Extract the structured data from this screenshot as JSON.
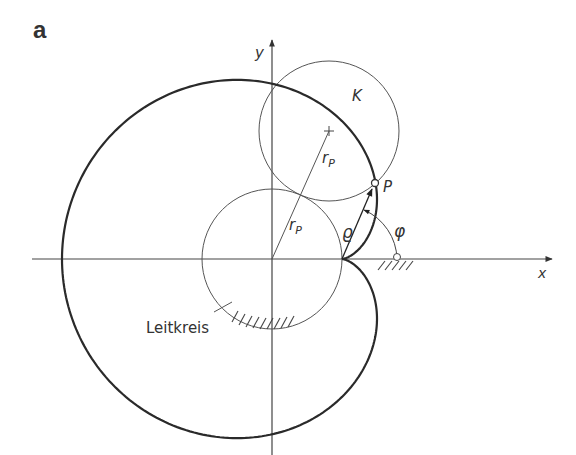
{
  "figure": {
    "panel_label": "a",
    "labels": {
      "y_axis": "y",
      "x_axis": "x",
      "rolling_circle": "K",
      "radius_upper": "r",
      "radius_upper_sub": "P",
      "radius_lower": "r",
      "radius_lower_sub": "P",
      "point": "P",
      "radius_vector": "ϱ",
      "angle": "φ",
      "fixed_circle": "Leitkreis"
    },
    "geometry": {
      "origin": [
        272,
        259
      ],
      "circle_radius": 70,
      "cusp": [
        342,
        259
      ],
      "rolling_circle_center": [
        329,
        131
      ],
      "point_P": [
        375,
        183
      ]
    },
    "colors": {
      "ink": "#333333",
      "thin": "#555555",
      "background": "#ffffff"
    }
  }
}
